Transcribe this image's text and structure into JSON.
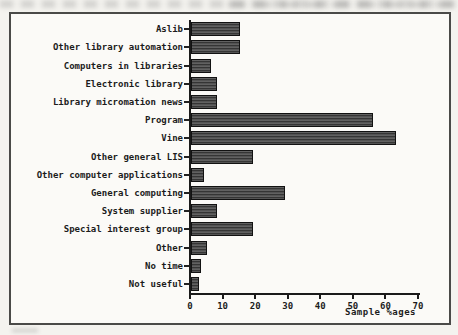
{
  "chart_data": {
    "type": "bar",
    "orientation": "horizontal",
    "title": "",
    "xlabel": "Sample %ages",
    "ylabel": "",
    "xlim": [
      0,
      70
    ],
    "xticks": [
      0,
      10,
      20,
      30,
      40,
      50,
      60,
      70
    ],
    "grid": false,
    "bar_color": "#4c4c4c",
    "categories": [
      "Aslib",
      "Other library automation",
      "Computers in libraries",
      "Electronic library",
      "Library micromation news",
      "Program",
      "Vine",
      "Other general LIS",
      "Other computer applications",
      "General computing",
      "System supplier",
      "Special interest group",
      "Other",
      "No time",
      "Not useful"
    ],
    "values": [
      15,
      15,
      6,
      8,
      8,
      56,
      63,
      19,
      4,
      29,
      8,
      19,
      5,
      3,
      2.5
    ]
  },
  "colors": {
    "paper": "#f4f3ef",
    "plot_background": "#fbfaf7",
    "frame_border": "#4a4a48",
    "axis": "#1a1a1a",
    "text": "#1c1c1c"
  }
}
